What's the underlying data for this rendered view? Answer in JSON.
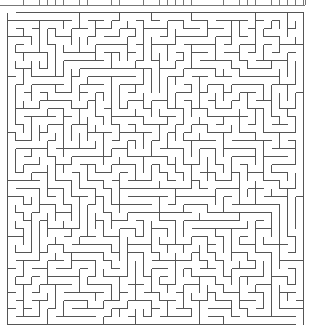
{
  "maze": {
    "cols": 37,
    "rows": 39,
    "cell_px": 8,
    "origin_x": 7,
    "origin_y": 12,
    "wall_color": "#555555",
    "wall_width": 1,
    "background": "#ffffff",
    "entrance": {
      "side": "top",
      "col": 0
    },
    "exit": {
      "side": "bottom",
      "col": 36
    },
    "seed": 20240611
  },
  "top_strip": {
    "y": 5,
    "x_start": 0,
    "x_end": 305,
    "tick_spacing": 8,
    "color": "#777777"
  }
}
